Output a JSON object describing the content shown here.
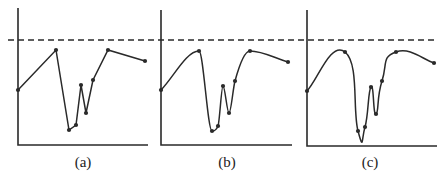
{
  "figure": {
    "stroke_color": "#2a2a2a",
    "dashed_line_y": 40,
    "panels": [
      {
        "id": "a",
        "caption": "(a)",
        "caption_x": 63,
        "axis": {
          "x0": 18,
          "ytop": 8,
          "ybase": 145,
          "xend": 148
        },
        "style": "linear",
        "points": [
          [
            18,
            90
          ],
          [
            56,
            50
          ],
          [
            69,
            130
          ],
          [
            76,
            125
          ],
          [
            81,
            85
          ],
          [
            86,
            113
          ],
          [
            93,
            80
          ],
          [
            108,
            50
          ],
          [
            145,
            61
          ]
        ]
      },
      {
        "id": "b",
        "caption": "(b)",
        "caption_x": 207,
        "axis": {
          "x0": 161,
          "ytop": 10,
          "ybase": 145,
          "xend": 292
        },
        "style": "monotone",
        "points": [
          [
            161,
            90
          ],
          [
            199,
            51
          ],
          [
            212,
            131
          ],
          [
            218,
            126
          ],
          [
            223,
            86
          ],
          [
            229,
            113
          ],
          [
            235,
            81
          ],
          [
            250,
            51
          ],
          [
            288,
            62
          ]
        ]
      },
      {
        "id": "c",
        "caption": "(c)",
        "caption_x": 350,
        "axis": {
          "x0": 307,
          "ytop": 10,
          "ybase": 146,
          "xend": 437
        },
        "style": "spline",
        "points": [
          [
            307,
            91
          ],
          [
            345,
            52
          ],
          [
            358,
            131
          ],
          [
            365,
            127
          ],
          [
            371,
            87
          ],
          [
            376,
            114
          ],
          [
            382,
            81
          ],
          [
            396,
            52
          ],
          [
            434,
            63
          ]
        ]
      }
    ],
    "dashed_line": {
      "x1": 8,
      "x2": 437,
      "y": 40
    }
  }
}
